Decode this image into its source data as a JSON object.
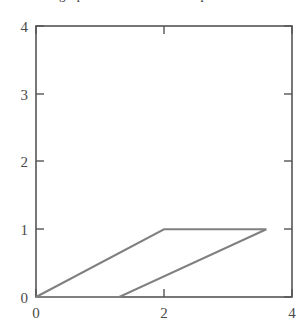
{
  "caption": {
    "text": "graph of the convolution product",
    "visible_fragment": "partially cropped text row at top edge"
  },
  "chart_data": {
    "type": "line",
    "title": "",
    "xlabel": "",
    "ylabel": "",
    "xlim": [
      0,
      4
    ],
    "ylim": [
      0,
      4
    ],
    "xticks": [
      0,
      2,
      4
    ],
    "xticklabels": [
      "0",
      "2",
      "4"
    ],
    "yticks": [
      0,
      1,
      2,
      3,
      4
    ],
    "yticklabels": [
      "0",
      "1",
      "2",
      "3",
      "4"
    ],
    "grid": false,
    "legend": null,
    "frame": "full-box",
    "tick_direction": "in",
    "ticks_on_all_sides": true,
    "line_color": "#808080",
    "line_width": 2,
    "series": [
      {
        "name": "convolution-parallelogram",
        "closed": true,
        "x": [
          0,
          2,
          3.6,
          1.3,
          0
        ],
        "y": [
          0,
          1,
          1,
          0,
          0
        ]
      }
    ],
    "annotations": []
  },
  "colors": {
    "background": "#ffffff",
    "axis": "#555555",
    "tick_label": "#4a4a4a",
    "data_line": "#808080"
  }
}
